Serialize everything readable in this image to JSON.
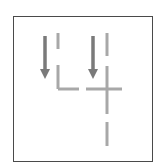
{
  "diagram": {
    "type": "wire-tile-diagram",
    "colors": {
      "frame": "#4a4a4a",
      "arrow": "#7a7a7a",
      "wire": "#a8a8a8",
      "background": "#ffffff"
    },
    "arrows": [
      {
        "name": "arrow-left",
        "direction": "down",
        "x": 45,
        "y1": 36,
        "y2": 79
      },
      {
        "name": "arrow-right",
        "direction": "down",
        "x": 93,
        "y1": 36,
        "y2": 79
      }
    ],
    "wires": [
      {
        "name": "left-wire-top-segment",
        "x1": 58,
        "y1": 33,
        "x2": 58,
        "y2": 49
      },
      {
        "name": "left-wire-corner-vertical",
        "x1": 58,
        "y1": 65,
        "x2": 58,
        "y2": 89
      },
      {
        "name": "left-wire-corner-horizontal",
        "x1": 58,
        "y1": 89,
        "x2": 79,
        "y2": 89
      },
      {
        "name": "right-wire-top-segment",
        "x1": 107,
        "y1": 33,
        "x2": 107,
        "y2": 56
      },
      {
        "name": "right-wire-vertical",
        "x1": 107,
        "y1": 66,
        "x2": 107,
        "y2": 114
      },
      {
        "name": "right-wire-horizontal",
        "x1": 86,
        "y1": 89,
        "x2": 122,
        "y2": 89
      },
      {
        "name": "right-wire-bottom-segment",
        "x1": 107,
        "y1": 122,
        "x2": 107,
        "y2": 146
      }
    ]
  }
}
